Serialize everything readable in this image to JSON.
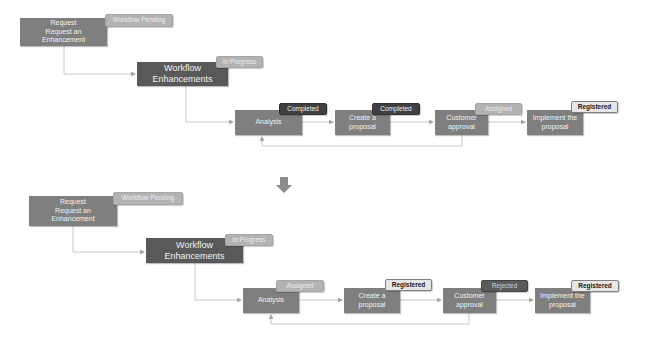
{
  "diagrams": [
    {
      "request": {
        "title": "Request",
        "text": "Request an Enhancement",
        "line1": "Request",
        "line2": "Request an",
        "line3": "Enhancement",
        "status": "Workflow Pending"
      },
      "workflow": {
        "line1": "Workflow",
        "line2": "Enhancements",
        "status": "In Progress"
      },
      "steps": [
        {
          "line1": "Analysis",
          "line2": "",
          "status": "Completed"
        },
        {
          "line1": "Create a",
          "line2": "proposal",
          "status": "Completed"
        },
        {
          "line1": "Customer",
          "line2": "approval",
          "status": "Assigned"
        },
        {
          "line1": "Implement the",
          "line2": "proposal",
          "status": "Registered"
        }
      ]
    },
    {
      "request": {
        "title": "Request",
        "text": "Request an Enhancement",
        "line1": "Request",
        "line2": "Request an",
        "line3": "Enhancement",
        "status": "Workflow Pending"
      },
      "workflow": {
        "line1": "Workflow",
        "line2": "Enhancements",
        "status": "In Progress"
      },
      "steps": [
        {
          "line1": "Analysis",
          "line2": "",
          "status": "Assigned"
        },
        {
          "line1": "Create a",
          "line2": "proposal",
          "status": "Registered"
        },
        {
          "line1": "Customer",
          "line2": "approval",
          "status": "Rejected"
        },
        {
          "line1": "Implement the",
          "line2": "proposal",
          "status": "Registered"
        }
      ]
    }
  ],
  "transition_arrow": {
    "icon": "down-arrow-icon",
    "color": "#8c8c8c"
  },
  "colors": {
    "box": "#7f7f7f",
    "box_dark": "#595959",
    "badge_light": "#b3b3b3",
    "badge_dark": "#404040",
    "badge_registered": "#e6e6e6",
    "connector": "#bfbfbf"
  }
}
